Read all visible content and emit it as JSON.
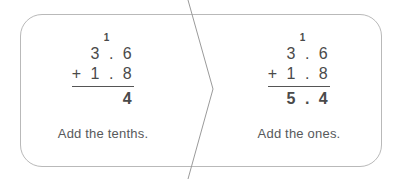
{
  "card": {
    "border_color": "#b9b9b9",
    "background_color": "#ffffff"
  },
  "divider": {
    "icon": "chevron-right-divider",
    "color": "#9a9a9a"
  },
  "panels": [
    {
      "id": "left",
      "problem": {
        "carry": "1",
        "addend_top": "3 . 6",
        "addend_bottom": "+ 1 . 8",
        "sum": "4"
      },
      "caption": "Add the tenths."
    },
    {
      "id": "right",
      "problem": {
        "carry": "1",
        "addend_top": "3 . 6",
        "addend_bottom": "+ 1 . 8",
        "sum": "5 . 4"
      },
      "caption": "Add the ones."
    }
  ],
  "colors": {
    "digits": "#4a4a4a",
    "caption": "#57595b",
    "rule": "#555555"
  }
}
